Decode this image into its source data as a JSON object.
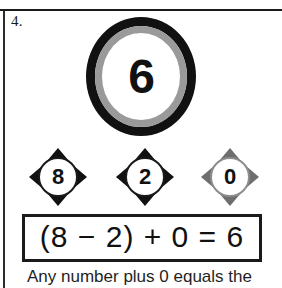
{
  "problem": {
    "number_label": "4.",
    "answer_circle": {
      "value": "6",
      "outer_ring_color": "#111111",
      "inner_ring_color": "#9a9a9a"
    },
    "number_diamonds": [
      {
        "value": "8",
        "style": "solid"
      },
      {
        "value": "2",
        "style": "solid"
      },
      {
        "value": "0",
        "style": "muted"
      }
    ],
    "equation": "(8 − 2) + 0 = 6",
    "caption": "Any number plus 0 equals the"
  }
}
